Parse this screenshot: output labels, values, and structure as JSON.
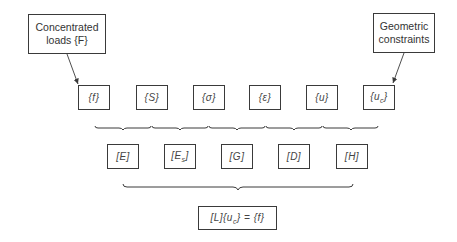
{
  "diagram": {
    "inputs": {
      "left": {
        "label_line1": "Concentrated",
        "label_line2": "loads {F}"
      },
      "right": {
        "label_line1": "Geometric",
        "label_line2": "constraints"
      }
    },
    "row1": [
      {
        "id": "f",
        "label": "{f}"
      },
      {
        "id": "S",
        "label": "{S}"
      },
      {
        "id": "sigma",
        "label": "{σ}"
      },
      {
        "id": "epsilon",
        "label": "{ε}"
      },
      {
        "id": "u",
        "label": "{u}"
      },
      {
        "id": "uc",
        "label": "{u",
        "sub": "c",
        "close": "}"
      }
    ],
    "row2": [
      {
        "id": "E",
        "label": "[E]"
      },
      {
        "id": "Es",
        "label": "[E",
        "sub": "s",
        "close": "]"
      },
      {
        "id": "G",
        "label": "[G]"
      },
      {
        "id": "D",
        "label": "[D]"
      },
      {
        "id": "H",
        "label": "[H]"
      }
    ],
    "result": {
      "part1": "[L]{u",
      "sub": "c",
      "part2": "} = {f}"
    },
    "colors": {
      "line": "#3a3a3a",
      "text": "#333333"
    }
  }
}
